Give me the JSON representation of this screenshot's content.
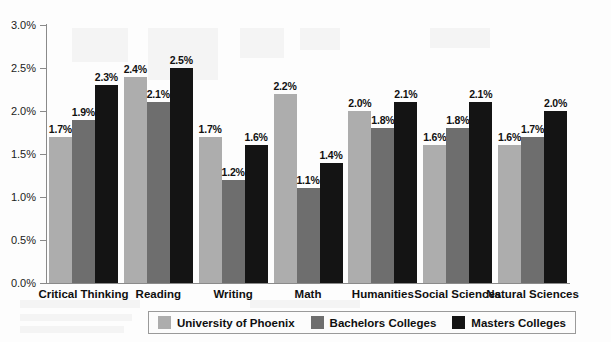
{
  "chart_data": {
    "type": "bar",
    "title": "",
    "xlabel": "",
    "ylabel": "",
    "ylim": [
      0,
      3.0
    ],
    "ytick_labels": [
      "0.0%",
      "0.5%",
      "1.0%",
      "1.5%",
      "2.0%",
      "2.5%",
      "3.0%"
    ],
    "ytick_values": [
      0,
      0.5,
      1.0,
      1.5,
      2.0,
      2.5,
      3.0
    ],
    "grid": false,
    "legend_position": "bottom",
    "categories": [
      "Critical Thinking",
      "Reading",
      "Writing",
      "Math",
      "Humanities",
      "Social Sciences",
      "Natural Sciences"
    ],
    "series": [
      {
        "name": "University of Phoenix",
        "color": "#adadad",
        "values": [
          1.7,
          2.4,
          1.7,
          2.2,
          2.0,
          1.6,
          1.6
        ],
        "labels": [
          "1.7%",
          "2.4%",
          "1.7%",
          "2.2%",
          "2.0%",
          "1.6%",
          "1.6%"
        ]
      },
      {
        "name": "Bachelors Colleges",
        "color": "#6e6e6e",
        "values": [
          1.9,
          2.1,
          1.2,
          1.1,
          1.8,
          1.8,
          1.7
        ],
        "labels": [
          "1.9%",
          "2.1%",
          "1.2%",
          "1.1%",
          "1.8%",
          "1.8%",
          "1.7%"
        ]
      },
      {
        "name": "Masters Colleges",
        "color": "#141414",
        "values": [
          2.3,
          2.5,
          1.6,
          1.4,
          2.1,
          2.1,
          2.0
        ],
        "labels": [
          "2.3%",
          "2.5%",
          "1.6%",
          "1.4%",
          "2.1%",
          "2.1%",
          "2.0%"
        ]
      }
    ]
  },
  "legend": {
    "items": [
      {
        "label": "University of Phoenix",
        "color": "#adadad"
      },
      {
        "label": "Bachelors Colleges",
        "color": "#6e6e6e"
      },
      {
        "label": "Masters  Colleges",
        "color": "#141414"
      }
    ]
  }
}
